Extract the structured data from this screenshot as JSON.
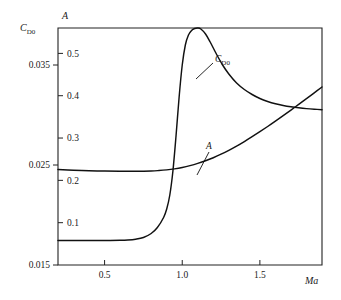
{
  "chart_data": {
    "type": "line",
    "title": "",
    "subtitle": "",
    "xlabel": "Ma",
    "xlabel_style": "italic",
    "ylabel_left": "C",
    "ylabel_left_sub": "D0",
    "ylabel_inner": "A",
    "grid": false,
    "legend_position": "inline-annotations",
    "xlim": [
      0.2,
      1.9
    ],
    "x_ticks": [
      0.5,
      1.0,
      1.5
    ],
    "x_tick_labels": [
      "0.5",
      "1.0",
      "1.5"
    ],
    "left_axis": {
      "name": "C_D0",
      "ylim": [
        0.015,
        0.0387
      ],
      "ticks": [
        0.015,
        0.025,
        0.035
      ],
      "tick_labels": [
        "0.015",
        "0.025",
        "0.035"
      ]
    },
    "inner_axis": {
      "name": "A",
      "ylim": [
        0.0,
        0.56
      ],
      "ticks": [
        0.1,
        0.2,
        0.3,
        0.4,
        0.5
      ],
      "tick_labels": [
        "0.1",
        "0.2",
        "0.3",
        "0.4",
        "0.5"
      ]
    },
    "annotations": [
      {
        "text": "C",
        "sub": "D0",
        "target_series": "C_D0"
      },
      {
        "text": "A",
        "sub": "",
        "target_series": "A"
      }
    ],
    "series": [
      {
        "name": "C_D0",
        "axis": "left",
        "label": "C_D0",
        "color": "#111111",
        "x": [
          0.2,
          0.3,
          0.4,
          0.5,
          0.6,
          0.65,
          0.7,
          0.75,
          0.8,
          0.84,
          0.88,
          0.9,
          0.92,
          0.94,
          0.96,
          0.98,
          1.0,
          1.02,
          1.04,
          1.06,
          1.08,
          1.1,
          1.12,
          1.15,
          1.18,
          1.22,
          1.26,
          1.3,
          1.35,
          1.4,
          1.45,
          1.5,
          1.55,
          1.6,
          1.65,
          1.7,
          1.75,
          1.8,
          1.85,
          1.9
        ],
        "y": [
          0.01745,
          0.01745,
          0.01745,
          0.01745,
          0.01747,
          0.0175,
          0.01758,
          0.01775,
          0.01815,
          0.01875,
          0.01975,
          0.0206,
          0.022,
          0.0244,
          0.0279,
          0.0318,
          0.035,
          0.037,
          0.038,
          0.03845,
          0.03865,
          0.0387,
          0.0386,
          0.0381,
          0.0373,
          0.0361,
          0.035,
          0.0341,
          0.0332,
          0.03255,
          0.03205,
          0.03165,
          0.03135,
          0.03112,
          0.03095,
          0.03082,
          0.03072,
          0.03064,
          0.03058,
          0.03053
        ]
      },
      {
        "name": "A",
        "axis": "inner",
        "label": "A",
        "color": "#111111",
        "x": [
          0.2,
          0.3,
          0.4,
          0.5,
          0.6,
          0.7,
          0.8,
          0.85,
          0.9,
          0.95,
          1.0,
          1.05,
          1.1,
          1.15,
          1.2,
          1.25,
          1.3,
          1.35,
          1.4,
          1.45,
          1.5,
          1.55,
          1.6,
          1.65,
          1.7,
          1.75,
          1.8,
          1.85,
          1.9
        ],
        "y": [
          0.2255,
          0.224,
          0.2228,
          0.222,
          0.2215,
          0.2215,
          0.2222,
          0.2232,
          0.2248,
          0.2272,
          0.2305,
          0.2348,
          0.24,
          0.2462,
          0.2535,
          0.2618,
          0.271,
          0.281,
          0.2918,
          0.3032,
          0.315,
          0.3272,
          0.3398,
          0.3528,
          0.366,
          0.3795,
          0.393,
          0.4068,
          0.4205
        ]
      }
    ]
  },
  "geometry": {
    "plot_left": 58,
    "plot_right": 322,
    "plot_top": 28,
    "plot_bottom": 265
  }
}
